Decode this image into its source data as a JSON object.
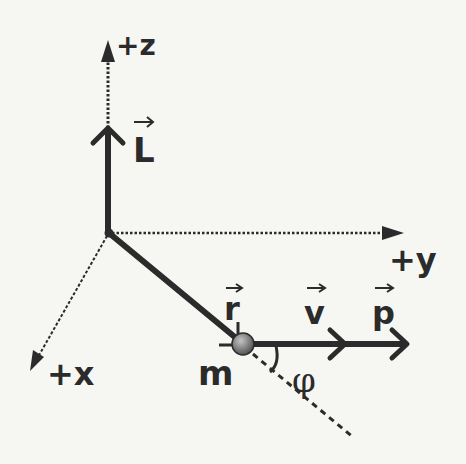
{
  "figure": {
    "type": "physics-vector-diagram",
    "topic": "angular momentum of a point mass"
  },
  "axes": {
    "z": {
      "label": "+z",
      "direction": "up"
    },
    "y": {
      "label": "+y",
      "direction": "right"
    },
    "x": {
      "label": "+x",
      "direction": "down-left (out of page)"
    }
  },
  "vectors": {
    "L": {
      "label": "L",
      "has_arrow_accent": true,
      "along": "+z"
    },
    "r": {
      "label": "r",
      "has_arrow_accent": true,
      "from": "origin",
      "to": "mass"
    },
    "v": {
      "label": "v",
      "has_arrow_accent": true,
      "along": "+y"
    },
    "p": {
      "label": "p",
      "has_arrow_accent": true,
      "along": "+y"
    }
  },
  "mass": {
    "label": "m"
  },
  "angle": {
    "label": "φ",
    "between": [
      "r-extension",
      "v/p"
    ]
  },
  "colors": {
    "background": "#f6f6f3",
    "ink": "#2b2b2b",
    "ball_light": "#b8b8b8",
    "ball_dark": "#4a4a4a"
  }
}
